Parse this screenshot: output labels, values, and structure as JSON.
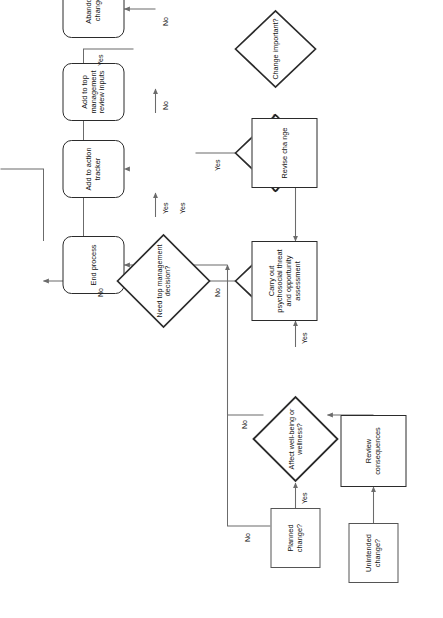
{
  "figure": {
    "orientation": "rotated-90-landscape",
    "line_color": "#6b6b6b",
    "border_color": "#2b2b2b"
  },
  "nodes": {
    "unintended_change": {
      "label": "Unintended change?",
      "shape": "process"
    },
    "review_consequences": {
      "label": "Review consequences",
      "shape": "process"
    },
    "planned_change": {
      "label": "Planned change?",
      "shape": "process"
    },
    "affect_wellbeing": {
      "label": "Affect well-being or wellness?",
      "shape": "decision"
    },
    "carry_out_assessment": {
      "label": "Carry out psychosocial threat and opportunity assessment",
      "shape": "process"
    },
    "revise_change": {
      "label": "Revise cha nge",
      "shape": "process"
    },
    "negative_effect": {
      "label": "Negative effect?",
      "shape": "decision"
    },
    "can_change_be_revised": {
      "label": "Can change be revised?",
      "shape": "decision"
    },
    "change_important": {
      "label": "Change important?",
      "shape": "decision"
    },
    "need_top_management_decision": {
      "label": "Need top management decision?",
      "shape": "decision"
    },
    "end_process": {
      "label": "End process",
      "shape": "terminator"
    },
    "add_to_action_tracker": {
      "label": "Add to action tracker",
      "shape": "terminator"
    },
    "add_to_top_management_review_inputs": {
      "label": "Add to top management review inputs",
      "shape": "terminator"
    },
    "abandon_change": {
      "label": "Abandon change",
      "shape": "terminator"
    }
  },
  "edge_labels": {
    "planned_change_no": "No",
    "planned_change_yes": "Yes",
    "affect_wellbeing_no": "No",
    "affect_wellbeing_yes": "Yes",
    "negative_effect_yes": "Yes",
    "negative_effect_no": "No",
    "can_change_be_revised_yes": "Yes",
    "can_change_be_revised_no": "No",
    "change_important_yes": "Yes",
    "change_important_no": "No",
    "need_top_management_decision_no": "No",
    "need_top_management_decision_yes": "Yes"
  }
}
